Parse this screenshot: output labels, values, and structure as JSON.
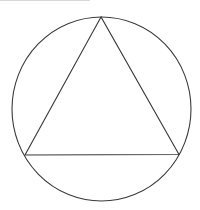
{
  "diagram": {
    "stroke_color": "#3a3a3a",
    "background": "#ffffff",
    "circle": {
      "cx": 101.5,
      "cy": 109,
      "rx": 89.5,
      "ry": 92
    },
    "triangle": {
      "vertices": [
        {
          "name": "top",
          "x": 101,
          "y": 17
        },
        {
          "name": "left",
          "x": 25,
          "y": 155
        },
        {
          "name": "right",
          "x": 179,
          "y": 154.5
        }
      ]
    }
  }
}
